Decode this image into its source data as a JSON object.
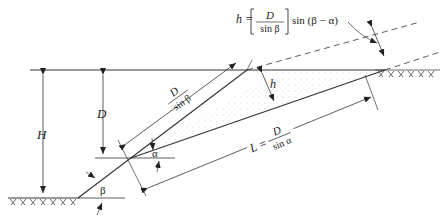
{
  "diagram": {
    "type": "slope-geometry",
    "labels": {
      "H": "H",
      "D": "D",
      "h": "h",
      "alpha": "α",
      "beta": "β",
      "L": "L",
      "eq": "=",
      "D_num": "D",
      "sin_beta": "sin β",
      "sin_alpha": "sin α"
    },
    "formula_h": {
      "lhs": "h =",
      "num": "D",
      "den": "sin β",
      "rhs": "sin (β − α)"
    },
    "colors": {
      "line": "#333333",
      "hatch": "#444444",
      "stipple": "#bbbbbb",
      "background": "#ffffff"
    }
  }
}
